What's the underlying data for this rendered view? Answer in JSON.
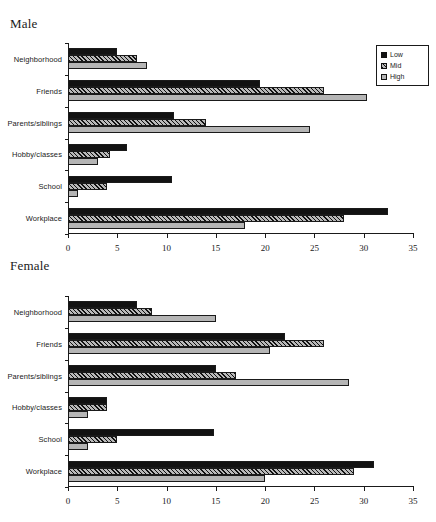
{
  "cut_header_text": "",
  "legend": {
    "items": [
      {
        "label": "Low",
        "key": "low",
        "swatch": "solid-black-swatch"
      },
      {
        "label": "Mid",
        "key": "mid",
        "swatch": "hatched-swatch"
      },
      {
        "label": "High",
        "key": "high",
        "swatch": "light-gray-swatch"
      }
    ]
  },
  "panels": [
    {
      "id": "male",
      "title": "Male"
    },
    {
      "id": "female",
      "title": "Female"
    }
  ],
  "axis": {
    "ticks": [
      "0",
      "5",
      "10",
      "15",
      "20",
      "25",
      "30",
      "35"
    ],
    "min": 0,
    "max": 35,
    "step": 5
  },
  "chart_data": [
    {
      "type": "bar",
      "orientation": "horizontal",
      "title": "Male",
      "xlabel": "",
      "ylabel": "",
      "xlim": [
        0,
        35
      ],
      "xticks": [
        0,
        5,
        10,
        15,
        20,
        25,
        30,
        35
      ],
      "grid": false,
      "legend_position": "top-right",
      "categories": [
        "Neighborhood",
        "Friends",
        "Parents/siblings",
        "Hobby/classes",
        "School",
        "Workplace"
      ],
      "series": [
        {
          "name": "Low",
          "values": [
            5.0,
            19.5,
            10.8,
            6.0,
            10.5,
            32.5
          ]
        },
        {
          "name": "Mid",
          "values": [
            7.0,
            26.0,
            14.0,
            4.3,
            4.0,
            28.0
          ]
        },
        {
          "name": "High",
          "values": [
            8.0,
            30.3,
            24.5,
            3.0,
            1.0,
            18.0
          ]
        }
      ]
    },
    {
      "type": "bar",
      "orientation": "horizontal",
      "title": "Female",
      "xlabel": "",
      "ylabel": "",
      "xlim": [
        0,
        35
      ],
      "xticks": [
        0,
        5,
        10,
        15,
        20,
        25,
        30,
        35
      ],
      "grid": false,
      "legend_position": "top-right",
      "categories": [
        "Neighborhood",
        "Friends",
        "Parents/siblings",
        "Hobby/classes",
        "School",
        "Workplace"
      ],
      "series": [
        {
          "name": "Low",
          "values": [
            7.0,
            22.0,
            15.0,
            4.0,
            14.8,
            31.0
          ]
        },
        {
          "name": "Mid",
          "values": [
            8.5,
            26.0,
            17.0,
            4.0,
            5.0,
            29.0
          ]
        },
        {
          "name": "High",
          "values": [
            15.0,
            20.5,
            28.5,
            2.0,
            2.0,
            20.0
          ]
        }
      ]
    }
  ]
}
